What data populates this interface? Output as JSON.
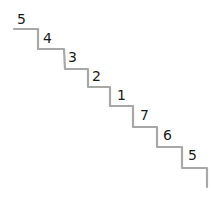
{
  "diagram": {
    "type": "staircase",
    "stroke_color": "#a8a8a8",
    "text_color": "#1a1a1a",
    "steps": [
      {
        "label": "5",
        "x": 17,
        "y": 12
      },
      {
        "label": "4",
        "x": 43,
        "y": 31
      },
      {
        "label": "3",
        "x": 68,
        "y": 50
      },
      {
        "label": "2",
        "x": 92,
        "y": 69
      },
      {
        "label": "1",
        "x": 117,
        "y": 88
      },
      {
        "label": "7",
        "x": 140,
        "y": 108
      },
      {
        "label": "6",
        "x": 163,
        "y": 128
      },
      {
        "label": "5",
        "x": 188,
        "y": 148
      }
    ]
  }
}
